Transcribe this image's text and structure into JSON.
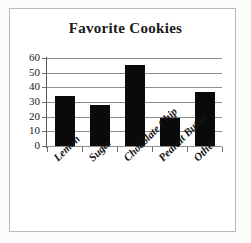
{
  "chart_data": {
    "type": "bar",
    "title": "Favorite Cookies",
    "categories": [
      "Lemon",
      "Sugar",
      "Chocolate Chip",
      "Peanut Butter",
      "Other"
    ],
    "values": [
      34,
      28,
      55,
      19,
      37
    ],
    "xlabel": "",
    "ylabel": "",
    "ylim": [
      0,
      60
    ],
    "yticks": [
      0,
      10,
      20,
      30,
      40,
      50,
      60
    ],
    "ytick_labels": [
      "0",
      "10",
      "20",
      "30",
      "40",
      "50",
      "60"
    ],
    "grid": true,
    "legend": false,
    "bar_color": "#0a0a0a",
    "grid_color": "#8c8c8c",
    "frame_color": "#b9b9b9",
    "background": "#ffffff"
  }
}
